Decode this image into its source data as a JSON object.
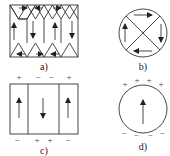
{
  "panels": {
    "a": {
      "label": "a)",
      "description": "Rectangular ferromagnet with four alternating domains and triangular closure domains"
    },
    "b": {
      "label": "b)",
      "description": "Circular particle with four closure domains forming flux loop"
    },
    "c": {
      "label": "c)",
      "description": "Rectangular ferromagnet with three alternating domains and surface poles"
    },
    "d": {
      "label": "d)",
      "description": "Circular single-domain particle with surface poles"
    }
  },
  "signs": {
    "c_top": [
      "+",
      "−",
      "−",
      "+"
    ],
    "c_bottom": [
      "−",
      "+",
      "+",
      "−"
    ],
    "d_top": [
      "+",
      "+",
      "+",
      "+"
    ],
    "d_bottom": [
      "−",
      "−",
      "−",
      "−"
    ]
  }
}
